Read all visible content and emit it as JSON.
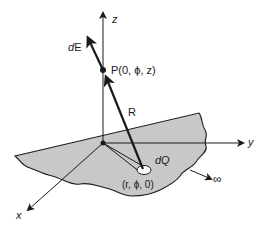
{
  "diagram": {
    "title": "",
    "labels": {
      "z_axis": "z",
      "y_axis": "y",
      "x_axis": "x",
      "field_vector": "dE",
      "point_P": "P(0, ϕ, z)",
      "distance": "R",
      "charge_element": "dQ",
      "charge_position": "(r, ϕ, 0)",
      "infinity": "∞"
    },
    "colors": {
      "surface_fill": "#c8c8c8",
      "ink": "#1a1a1a",
      "background": "#ffffff"
    }
  }
}
